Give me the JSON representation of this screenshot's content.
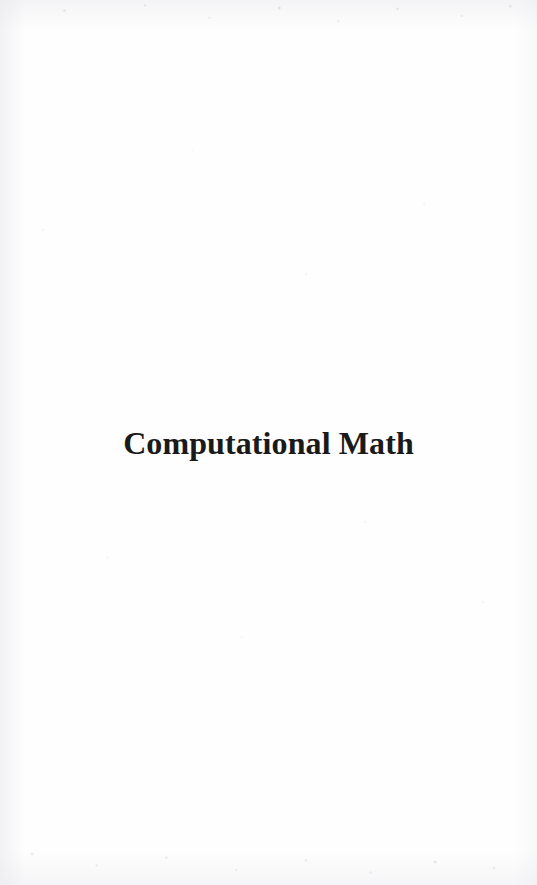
{
  "page": {
    "kind": "book-part-title-page",
    "background_color": "#fefefe",
    "width": 537,
    "height": 885
  },
  "part_title": {
    "text": "Computational Math",
    "color": "#1a1a1a",
    "alignment": "center"
  }
}
